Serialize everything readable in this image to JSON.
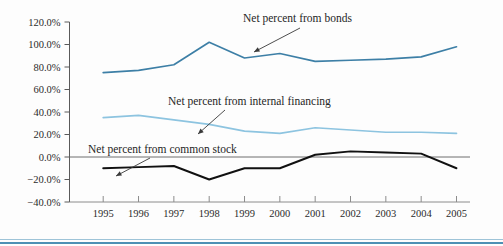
{
  "chart_data": {
    "type": "line",
    "title": "",
    "subtitle": "",
    "xlabel": "",
    "ylabel": "",
    "grid": false,
    "legend_position": "inline-annotations",
    "x": [
      1995,
      1996,
      1997,
      1998,
      1999,
      2000,
      2001,
      2002,
      2003,
      2004,
      2005
    ],
    "categories": [
      "1995",
      "1996",
      "1997",
      "1998",
      "1999",
      "2000",
      "2001",
      "2002",
      "2003",
      "2004",
      "2005"
    ],
    "xlim": [
      1995,
      2005
    ],
    "ylim": [
      -40,
      120
    ],
    "ytick_values": [
      120,
      100,
      80,
      60,
      40,
      20,
      0,
      -20,
      -40
    ],
    "ytick_labels": [
      "120.0%",
      "100.0%",
      "80.0%",
      "60.0%",
      "40.0%",
      "20.0%",
      "0.0%",
      "-20.0%",
      "-40.0%"
    ],
    "yunit": "percent",
    "series": [
      {
        "name": "Net percent from bonds",
        "color": "#3d7fa6",
        "values": [
          75,
          77,
          82,
          102,
          88,
          92,
          85,
          86,
          87,
          89,
          98
        ]
      },
      {
        "name": "Net percent from internal financing",
        "color": "#8dc4e0",
        "values": [
          35,
          37,
          33,
          29,
          23,
          21,
          26,
          24,
          22,
          22,
          21
        ]
      },
      {
        "name": "Net percent from common stock",
        "color": "#111111",
        "values": [
          -10,
          -9,
          -8,
          -20,
          -10,
          -10,
          2,
          5,
          4,
          3,
          -10
        ]
      }
    ],
    "annotations": [
      {
        "label": "Net percent from bonds",
        "series": "Net percent from bonds",
        "target_x": 1999,
        "target_y": 88,
        "text_x": 243,
        "text_y": 22,
        "arrow_from_x": 300,
        "arrow_from_y": 28,
        "arrow_to_x": 254,
        "arrow_to_y": 52
      },
      {
        "label": "Net percent from internal financing",
        "series": "Net percent from internal financing",
        "target_x": 1999,
        "target_y": 23,
        "text_x": 168,
        "text_y": 105,
        "arrow_from_x": 225,
        "arrow_from_y": 110,
        "arrow_to_x": 198,
        "arrow_to_y": 134
      },
      {
        "label": "Net percent from common stock",
        "series": "Net percent from common stock",
        "target_x": 1995,
        "target_y": -10,
        "text_x": 88,
        "text_y": 153,
        "arrow_from_x": 150,
        "arrow_from_y": 158,
        "arrow_to_x": 116,
        "arrow_to_y": 176
      }
    ],
    "zero_line": 0,
    "colors": {
      "bonds": "#3d7fa6",
      "internal_financing": "#8dc4e0",
      "common_stock": "#111111",
      "axis": "#5a5a5a",
      "bottom_rule": "#6aa6c8",
      "background": "#fdfdfd"
    }
  }
}
